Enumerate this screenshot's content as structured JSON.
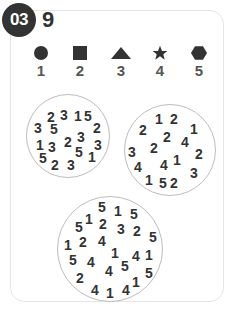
{
  "puzzle": {
    "number": "03",
    "target": "9"
  },
  "legend": [
    {
      "shape": "circle",
      "value": "1",
      "x": 41
    },
    {
      "shape": "square",
      "value": "2",
      "x": 80
    },
    {
      "shape": "triangle",
      "value": "3",
      "x": 121
    },
    {
      "shape": "star",
      "value": "4",
      "x": 160
    },
    {
      "shape": "hexagon",
      "value": "5",
      "x": 199
    }
  ],
  "circles": [
    {
      "cx": 68,
      "cy": 136,
      "r": 42,
      "digits": [
        {
          "d": "2",
          "x": 51,
          "y": 117
        },
        {
          "d": "3",
          "x": 64,
          "y": 115
        },
        {
          "d": "1",
          "x": 78,
          "y": 116
        },
        {
          "d": "5",
          "x": 88,
          "y": 116
        },
        {
          "d": "3",
          "x": 38,
          "y": 128
        },
        {
          "d": "5",
          "x": 54,
          "y": 129
        },
        {
          "d": "2",
          "x": 97,
          "y": 128
        },
        {
          "d": "3",
          "x": 81,
          "y": 137
        },
        {
          "d": "2",
          "x": 68,
          "y": 142
        },
        {
          "d": "1",
          "x": 40,
          "y": 145
        },
        {
          "d": "3",
          "x": 52,
          "y": 147
        },
        {
          "d": "3",
          "x": 98,
          "y": 145
        },
        {
          "d": "5",
          "x": 79,
          "y": 152
        },
        {
          "d": "1",
          "x": 92,
          "y": 157
        },
        {
          "d": "5",
          "x": 43,
          "y": 158
        },
        {
          "d": "2",
          "x": 55,
          "y": 165
        },
        {
          "d": "3",
          "x": 71,
          "y": 165
        }
      ]
    },
    {
      "cx": 170,
      "cy": 150,
      "r": 46,
      "digits": [
        {
          "d": "1",
          "x": 159,
          "y": 119
        },
        {
          "d": "2",
          "x": 174,
          "y": 119
        },
        {
          "d": "2",
          "x": 143,
          "y": 130
        },
        {
          "d": "1",
          "x": 194,
          "y": 129
        },
        {
          "d": "2",
          "x": 167,
          "y": 137
        },
        {
          "d": "4",
          "x": 185,
          "y": 142
        },
        {
          "d": "3",
          "x": 132,
          "y": 152
        },
        {
          "d": "2",
          "x": 154,
          "y": 148
        },
        {
          "d": "2",
          "x": 199,
          "y": 154
        },
        {
          "d": "1",
          "x": 177,
          "y": 160
        },
        {
          "d": "4",
          "x": 138,
          "y": 167
        },
        {
          "d": "4",
          "x": 164,
          "y": 165
        },
        {
          "d": "3",
          "x": 194,
          "y": 173
        },
        {
          "d": "1",
          "x": 149,
          "y": 180
        },
        {
          "d": "5",
          "x": 163,
          "y": 183
        },
        {
          "d": "2",
          "x": 174,
          "y": 183
        }
      ]
    },
    {
      "cx": 110,
      "cy": 249,
      "r": 53,
      "digits": [
        {
          "d": "5",
          "x": 102,
          "y": 207
        },
        {
          "d": "1",
          "x": 118,
          "y": 211
        },
        {
          "d": "5",
          "x": 134,
          "y": 214
        },
        {
          "d": "5",
          "x": 79,
          "y": 227
        },
        {
          "d": "1",
          "x": 89,
          "y": 219
        },
        {
          "d": "2",
          "x": 103,
          "y": 224
        },
        {
          "d": "3",
          "x": 121,
          "y": 229
        },
        {
          "d": "2",
          "x": 137,
          "y": 231
        },
        {
          "d": "5",
          "x": 153,
          "y": 237
        },
        {
          "d": "1",
          "x": 68,
          "y": 245
        },
        {
          "d": "2",
          "x": 83,
          "y": 242
        },
        {
          "d": "4",
          "x": 102,
          "y": 241
        },
        {
          "d": "1",
          "x": 115,
          "y": 253
        },
        {
          "d": "4",
          "x": 136,
          "y": 256
        },
        {
          "d": "1",
          "x": 149,
          "y": 255
        },
        {
          "d": "5",
          "x": 73,
          "y": 260
        },
        {
          "d": "4",
          "x": 91,
          "y": 262
        },
        {
          "d": "4",
          "x": 109,
          "y": 271
        },
        {
          "d": "5",
          "x": 125,
          "y": 266
        },
        {
          "d": "5",
          "x": 149,
          "y": 273
        },
        {
          "d": "2",
          "x": 80,
          "y": 278
        },
        {
          "d": "4",
          "x": 95,
          "y": 290
        },
        {
          "d": "1",
          "x": 110,
          "y": 293
        },
        {
          "d": "4",
          "x": 126,
          "y": 290
        },
        {
          "d": "1",
          "x": 136,
          "y": 282
        }
      ]
    }
  ],
  "colors": {
    "ink": "#333333",
    "legend_num": "#555555",
    "ring": "#bdbdbd",
    "card_border": "#e6e6e6"
  }
}
